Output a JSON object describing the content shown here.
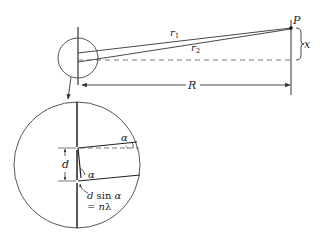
{
  "diagram": {
    "type": "double-slit geometry",
    "labels": {
      "point": "P",
      "ray1": "r",
      "ray1_sub": "1",
      "ray2": "r",
      "ray2_sub": "2",
      "displacement": "x",
      "distance": "R",
      "slit_spacing": "d",
      "angle_top": "α",
      "angle_bottom": "α",
      "path_diff_line1_a": "d",
      "path_diff_line1_b": " sin ",
      "path_diff_line1_c": "α",
      "path_diff_line2_a": "= ",
      "path_diff_line2_b": "n",
      "path_diff_line2_c": "λ"
    },
    "colors": {
      "stroke": "#333333",
      "background": "#ffffff"
    }
  }
}
